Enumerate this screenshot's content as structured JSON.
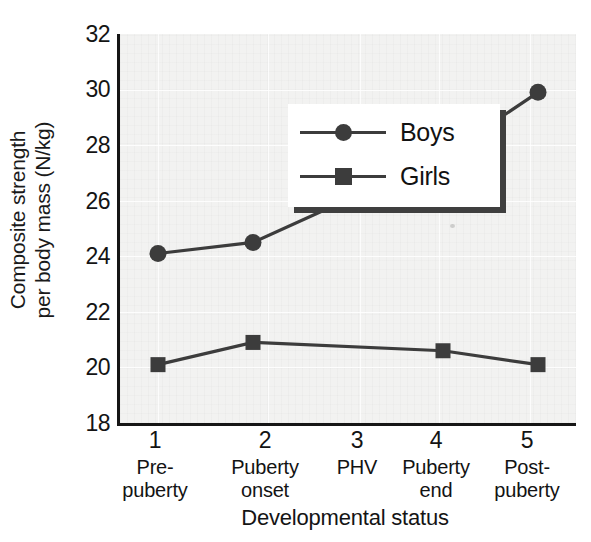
{
  "chart_data": {
    "type": "line",
    "title": "",
    "xlabel": "Developmental status",
    "ylabel": "Composite strength per body mass (N/kg)",
    "ylabel_lines": [
      "Composite strength",
      "per body mass (N/kg)"
    ],
    "x": [
      1,
      2,
      3,
      4,
      5
    ],
    "categories": [
      "Pre-puberty",
      "Puberty onset",
      "PHV",
      "Puberty end",
      "Post-puberty"
    ],
    "category_lines": [
      [
        "Pre-",
        "puberty"
      ],
      [
        "Puberty",
        "onset"
      ],
      [
        "PHV"
      ],
      [
        "Puberty",
        "end"
      ],
      [
        "Post-",
        "puberty"
      ]
    ],
    "xtick_labels": [
      "1",
      "2",
      "3",
      "4",
      "5"
    ],
    "ytick_labels": [
      "32",
      "30",
      "28",
      "26",
      "24",
      "22",
      "20",
      "18"
    ],
    "yticks": [
      32,
      30,
      28,
      26,
      24,
      22,
      20,
      18
    ],
    "ylim": [
      18,
      32
    ],
    "xlim": [
      0.6,
      5.4
    ],
    "grid": false,
    "legend_position": "upper-left-inside",
    "series": [
      {
        "name": "Boys",
        "marker": "circle",
        "color": "#3c3c3c",
        "x": [
          1,
          2,
          4,
          5
        ],
        "values": [
          24.1,
          24.5,
          27.6,
          29.9
        ]
      },
      {
        "name": "Girls",
        "marker": "square",
        "color": "#3c3c3c",
        "x": [
          1,
          2,
          4,
          5
        ],
        "values": [
          20.1,
          20.9,
          20.6,
          20.1
        ]
      }
    ]
  },
  "legend": {
    "items": [
      {
        "label": "Boys",
        "marker": "circle"
      },
      {
        "label": "Girls",
        "marker": "square"
      }
    ]
  },
  "axes": {
    "y_title_line1": "Composite strength",
    "y_title_line2": "per body mass (N/kg)",
    "x_title": "Developmental status",
    "ytick_0": "32",
    "ytick_1": "30",
    "ytick_2": "28",
    "ytick_3": "26",
    "ytick_4": "24",
    "ytick_5": "22",
    "ytick_6": "20",
    "ytick_7": "18",
    "xtick_0": "1",
    "xtick_1": "2",
    "xtick_2": "3",
    "xtick_3": "4",
    "xtick_4": "5",
    "xcat_0_l1": "Pre-",
    "xcat_0_l2": "puberty",
    "xcat_1_l1": "Puberty",
    "xcat_1_l2": "onset",
    "xcat_2_l1": "PHV",
    "xcat_2_l2": "",
    "xcat_3_l1": "Puberty",
    "xcat_3_l2": "end",
    "xcat_4_l1": "Post-",
    "xcat_4_l2": "puberty"
  },
  "colors": {
    "series": "#3c3c3c",
    "axis": "#161616",
    "plot_background": "#f2f2f1",
    "legend_shadow": "#3f3f3f",
    "page_background": "#ffffff"
  }
}
